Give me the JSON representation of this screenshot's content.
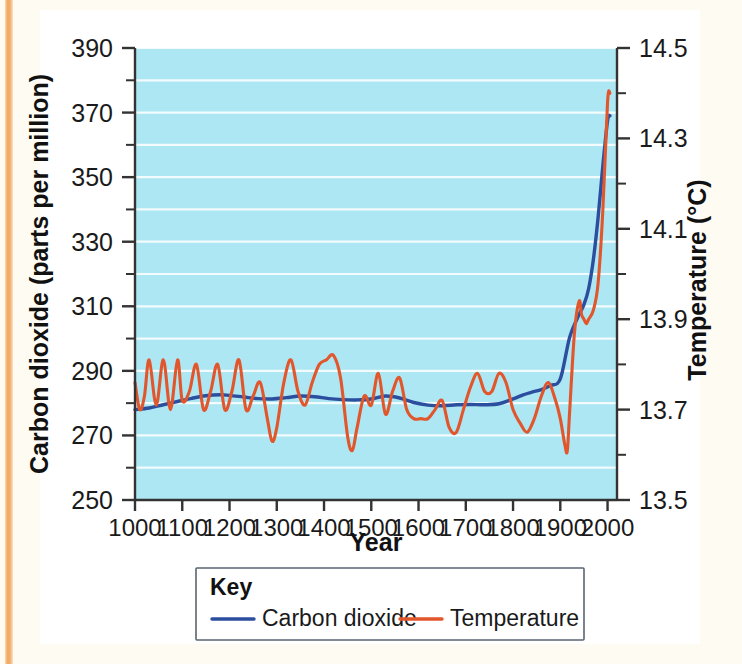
{
  "figure": {
    "background_color": "#fdfbf2",
    "panel_color": "#ffffff",
    "margin_stripe_color": "#f2a65a"
  },
  "chart_data": {
    "type": "line",
    "title": "",
    "subtitle": "",
    "xlabel": "Year",
    "ylabel": "Carbon dioxide (parts per million)",
    "y2label": "Temperature (°C)",
    "xlim": [
      1000,
      2020
    ],
    "ylim": [
      250,
      390
    ],
    "y2lim": [
      13.5,
      14.5
    ],
    "xticks": [
      1000,
      1100,
      1200,
      1300,
      1400,
      1500,
      1600,
      1700,
      1800,
      1900,
      2000
    ],
    "xtick_labels": [
      "1000",
      "1100",
      "1200",
      "1300",
      "1400",
      "1500",
      "1600",
      "1700",
      "1800",
      "1900",
      "2000"
    ],
    "yticks": [
      250,
      270,
      290,
      310,
      330,
      350,
      370,
      390
    ],
    "ytick_labels": [
      "250",
      "270",
      "290",
      "310",
      "330",
      "350",
      "370",
      "390"
    ],
    "y_minor_ticks": [
      260,
      280,
      300,
      320,
      340,
      360,
      380
    ],
    "y2ticks": [
      13.5,
      13.7,
      13.9,
      14.1,
      14.3,
      14.5
    ],
    "y2tick_labels": [
      "13.5",
      "13.7",
      "13.9",
      "14.1",
      "14.3",
      "14.5"
    ],
    "y2_minor_ticks": [
      13.6,
      13.8,
      14.0,
      14.2,
      14.4
    ],
    "grid": true,
    "grid_color": "#ffffff",
    "grid_orientation": "horizontal",
    "plot_background": "#ace7f3",
    "legend_position": "below-center",
    "legend_title": "Key",
    "series": [
      {
        "name": "Carbon dioxide",
        "color": "#2b4f9e",
        "axis": "left",
        "units": "parts per million",
        "x": [
          1000,
          1030,
          1060,
          1090,
          1120,
          1150,
          1180,
          1200,
          1230,
          1260,
          1290,
          1320,
          1350,
          1380,
          1410,
          1440,
          1470,
          1500,
          1530,
          1560,
          1590,
          1620,
          1650,
          1680,
          1710,
          1740,
          1770,
          1800,
          1820,
          1840,
          1860,
          1880,
          1900,
          1920,
          1940,
          1950,
          1960,
          1970,
          1980,
          1990,
          2000,
          2005
        ],
        "values": [
          278.0,
          278.5,
          279.5,
          280.5,
          281.5,
          282.3,
          282.6,
          282.4,
          281.9,
          281.4,
          281.3,
          281.7,
          282.2,
          282.0,
          281.4,
          281.1,
          281.0,
          281.3,
          282.2,
          281.6,
          280.2,
          279.4,
          279.2,
          279.5,
          279.6,
          279.5,
          279.8,
          281.3,
          282.5,
          283.4,
          284.2,
          285.5,
          287.5,
          300.5,
          307.5,
          310.5,
          315.5,
          324.5,
          337.5,
          353.5,
          367.5,
          369.0
        ]
      },
      {
        "name": "Temperature",
        "color": "#e2562c",
        "axis": "right",
        "units": "°C",
        "x": [
          1000,
          1010,
          1020,
          1030,
          1045,
          1060,
          1075,
          1090,
          1100,
          1115,
          1130,
          1145,
          1160,
          1175,
          1190,
          1205,
          1220,
          1235,
          1250,
          1265,
          1280,
          1290,
          1300,
          1315,
          1330,
          1345,
          1360,
          1375,
          1390,
          1405,
          1420,
          1435,
          1450,
          1460,
          1470,
          1485,
          1500,
          1515,
          1530,
          1545,
          1560,
          1575,
          1590,
          1605,
          1620,
          1635,
          1650,
          1665,
          1680,
          1695,
          1710,
          1725,
          1740,
          1755,
          1770,
          1785,
          1800,
          1815,
          1830,
          1845,
          1860,
          1875,
          1890,
          1900,
          1910,
          1915,
          1920,
          1930,
          1940,
          1945,
          1950,
          1955,
          1960,
          1970,
          1980,
          1990,
          2000,
          2005
        ],
        "values": [
          13.76,
          13.7,
          13.73,
          13.81,
          13.71,
          13.81,
          13.7,
          13.81,
          13.72,
          13.74,
          13.8,
          13.7,
          13.74,
          13.8,
          13.7,
          13.74,
          13.81,
          13.7,
          13.73,
          13.76,
          13.68,
          13.63,
          13.66,
          13.76,
          13.81,
          13.74,
          13.71,
          13.76,
          13.8,
          13.81,
          13.82,
          13.77,
          13.64,
          13.61,
          13.66,
          13.73,
          13.71,
          13.78,
          13.69,
          13.74,
          13.77,
          13.7,
          13.68,
          13.68,
          13.68,
          13.7,
          13.72,
          13.66,
          13.65,
          13.7,
          13.75,
          13.78,
          13.74,
          13.74,
          13.78,
          13.76,
          13.7,
          13.67,
          13.65,
          13.68,
          13.73,
          13.76,
          13.72,
          13.68,
          13.62,
          13.61,
          13.7,
          13.87,
          13.94,
          13.91,
          13.9,
          13.89,
          13.9,
          13.92,
          13.98,
          14.14,
          14.38,
          14.4
        ]
      }
    ],
    "annotations": []
  },
  "legend": {
    "title": "Key",
    "entries": [
      {
        "label": "Carbon dioxide",
        "color": "#2b4f9e"
      },
      {
        "label": "Temperature",
        "color": "#e2562c"
      }
    ]
  }
}
